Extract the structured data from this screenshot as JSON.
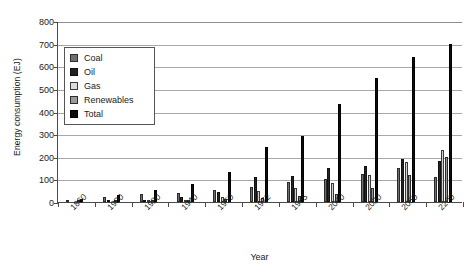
{
  "chart_data": {
    "type": "bar",
    "title": "",
    "xlabel": "Year",
    "ylabel": "Energy consumption (EJ)",
    "ylim": [
      0,
      800
    ],
    "ytick_step": 100,
    "yticks": [
      "0",
      "100",
      "200",
      "300",
      "400",
      "500",
      "600",
      "700",
      "800"
    ],
    "grid": true,
    "grid_axis": "y",
    "legend_position": "upper-left-inside",
    "categories": [
      "1860",
      "1900",
      "1920",
      "1940",
      "1960",
      "1972",
      "1985",
      "2000",
      "2020",
      "2050",
      "2200"
    ],
    "series": [
      {
        "name": "Coal",
        "color": "#6f6f6f",
        "values": [
          8,
          18,
          30,
          38,
          55,
          68,
          82,
          92,
          120,
          135,
          95
        ]
      },
      {
        "name": "Oil",
        "color": "#242424",
        "values": [
          0,
          4,
          12,
          22,
          48,
          98,
          110,
          128,
          148,
          175,
          160
        ]
      },
      {
        "name": "Gas",
        "color": "#d2d2d2",
        "values": [
          0,
          1,
          4,
          10,
          25,
          48,
          68,
          85,
          120,
          190,
          205
        ]
      },
      {
        "name": "Renewables",
        "color": "#9a9a9a",
        "values": [
          5,
          6,
          8,
          10,
          14,
          20,
          28,
          42,
          78,
          180,
          260
        ]
      },
      {
        "name": "Total",
        "color": "#0d0d0d",
        "values": [
          13,
          29,
          54,
          80,
          142,
          234,
          288,
          347,
          466,
          680,
          720
        ]
      }
    ],
    "legend_entries": [
      "Coal",
      "Oil",
      "Gas",
      "Renewables",
      "Total"
    ]
  },
  "groups": [
    {
      "label": "1860",
      "values": {
        "Coal": 8,
        "Oil": 0,
        "Gas": 0,
        "Renewables": 5,
        "Total": 13
      }
    },
    {
      "label": "1900",
      "values": {
        "Coal": 22,
        "Oil": 2,
        "Gas": 0,
        "Renewables": 6,
        "Total": 30
      }
    },
    {
      "label": "1920",
      "values": {
        "Coal": 35,
        "Oil": 8,
        "Gas": 2,
        "Renewables": 8,
        "Total": 53
      }
    },
    {
      "label": "1940",
      "values": {
        "Coal": 40,
        "Oil": 22,
        "Gas": 8,
        "Renewables": 10,
        "Total": 80
      }
    },
    {
      "label": "1960",
      "values": {
        "Coal": 55,
        "Oil": 45,
        "Gas": 22,
        "Renewables": 12,
        "Total": 134
      }
    },
    {
      "label": "1972",
      "values": {
        "Coal": 68,
        "Oil": 110,
        "Gas": 48,
        "Renewables": 18,
        "Total": 244
      }
    },
    {
      "label": "1985",
      "values": {
        "Coal": 90,
        "Oil": 115,
        "Gas": 62,
        "Renewables": 25,
        "Total": 292
      }
    },
    {
      "label": "2000",
      "values": {
        "Coal": 100,
        "Oil": 150,
        "Gas": 85,
        "Renewables": 35,
        "Total": 435
      }
    },
    {
      "label": "2020",
      "values": {
        "Coal": 125,
        "Oil": 160,
        "Gas": 120,
        "Renewables": 60,
        "Total": 550
      }
    },
    {
      "label": "2050",
      "values": {
        "Coal": 150,
        "Oil": 190,
        "Gas": 175,
        "Renewables": 120,
        "Total": 640
      }
    },
    {
      "label": "2200",
      "values": {
        "Coal": 110,
        "Oil": 180,
        "Gas": 230,
        "Renewables": 200,
        "Total": 700
      }
    }
  ],
  "axes": {
    "y_title": "Energy consumption (EJ)",
    "x_title": "Year"
  }
}
